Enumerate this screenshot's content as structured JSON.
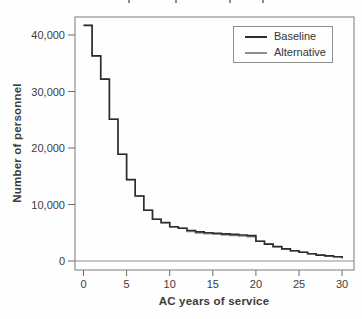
{
  "figure": {
    "note_top_edge": "cropped title descender fragments"
  },
  "chart_data": {
    "type": "line",
    "line_style": "step-post",
    "title": "",
    "xlabel": "AC years of service",
    "ylabel": "Number of personnel",
    "x_tick_labels": [
      "0",
      "5",
      "10",
      "15",
      "20",
      "25",
      "30"
    ],
    "x_tick_values": [
      0,
      5,
      10,
      15,
      20,
      25,
      30
    ],
    "y_tick_labels": [
      "0",
      "10,000",
      "20,000",
      "30,000",
      "40,000"
    ],
    "y_tick_values": [
      0,
      10000,
      20000,
      30000,
      40000
    ],
    "xlim": [
      0,
      30
    ],
    "ylim": [
      0,
      40000
    ],
    "grid": false,
    "zero_reference_line": true,
    "legend_position": "top-right-inside",
    "x_years": [
      0,
      1,
      2,
      3,
      4,
      5,
      6,
      7,
      8,
      9,
      10,
      11,
      12,
      13,
      14,
      15,
      16,
      17,
      18,
      19,
      20,
      21,
      22,
      23,
      24,
      25,
      26,
      27,
      28,
      29
    ],
    "series": [
      {
        "name": "Baseline",
        "color": "#2d2d2d",
        "values": [
          41700,
          36300,
          32200,
          25100,
          18900,
          14400,
          11500,
          9000,
          7400,
          6800,
          6050,
          5800,
          5400,
          5150,
          5000,
          4900,
          4800,
          4700,
          4600,
          4500,
          3500,
          3000,
          2550,
          2150,
          1800,
          1550,
          1300,
          1050,
          900,
          750
        ],
        "end_value": 500
      },
      {
        "name": "Alternative",
        "color": "#8f8f8f",
        "values": [
          41700,
          36300,
          32200,
          25100,
          18900,
          14400,
          11500,
          9000,
          7400,
          6800,
          6050,
          5800,
          5200,
          4950,
          4800,
          4700,
          4600,
          4500,
          4400,
          4300,
          3500,
          3000,
          2550,
          2150,
          1800,
          1550,
          1300,
          1050,
          900,
          750
        ],
        "end_value": 500
      }
    ]
  }
}
